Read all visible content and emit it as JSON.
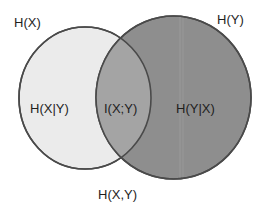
{
  "diagram": {
    "type": "venn",
    "sets": [
      {
        "id": "X",
        "label": "H(X)"
      },
      {
        "id": "Y",
        "label": "H(Y)"
      }
    ],
    "regions": {
      "x_only": "H(X|Y)",
      "intersection": "I(X;Y)",
      "y_only": "H(Y|X)"
    },
    "union_label": "H(X,Y)"
  },
  "colors": {
    "background": "#ffffff",
    "x_fill": "#ebebeb",
    "y_fill": "#8e8e8e",
    "intersection_fill": "#a4a4a4",
    "stroke": "#4a4a4a",
    "text": "#1e1e1e"
  }
}
